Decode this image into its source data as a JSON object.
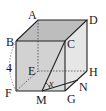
{
  "figure": {
    "vertices": [
      "A",
      "B",
      "C",
      "D",
      "E",
      "F",
      "G",
      "H"
    ],
    "points": [
      "M",
      "N"
    ],
    "edge_label": "4",
    "angle_label": "x",
    "colors": {
      "front_face": "#cfcfcf",
      "top_face": "#bdbdbd",
      "right_face": "#e3e3e3",
      "line": "#222222"
    }
  },
  "labels": {
    "A": "A",
    "B": "B",
    "C": "C",
    "D": "D",
    "E": "E",
    "F": "F",
    "G": "G",
    "H": "H",
    "M": "M",
    "N": "N",
    "side": "4",
    "angle": "x"
  }
}
